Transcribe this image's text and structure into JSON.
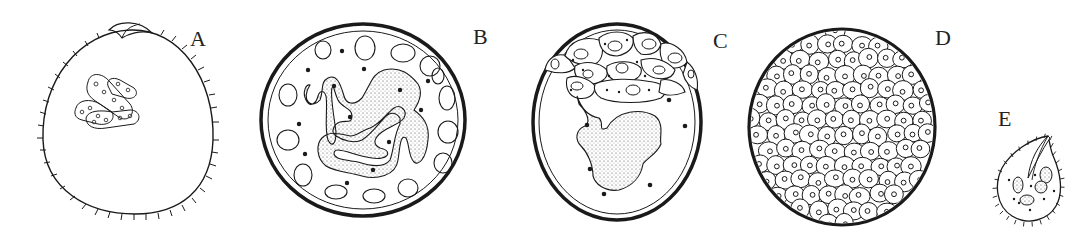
{
  "figure": {
    "panels": [
      {
        "id": "A",
        "label": "A",
        "description": "Oval trophont with ciliated outer margin, cytostome at top, and elongated segmented macronucleus fragments in the center"
      },
      {
        "id": "B",
        "label": "B",
        "description": "Encysted stage with thick wall, stippled convoluted macronucleus, peripheral vacuoles and dark granules"
      },
      {
        "id": "C",
        "label": "C",
        "description": "Cyst with cap of dividing cells at top and stippled nuclear mass below, scattered dark granules"
      },
      {
        "id": "D",
        "label": "D",
        "description": "Mature cyst filled with numerous small cells (tomites), each with a nucleus"
      },
      {
        "id": "E",
        "label": "E",
        "description": "Small ciliated tomite/theront with oral apparatus and nuclei"
      }
    ]
  },
  "colors": {
    "ink": "#1a1a1a",
    "background": "#ffffff"
  }
}
